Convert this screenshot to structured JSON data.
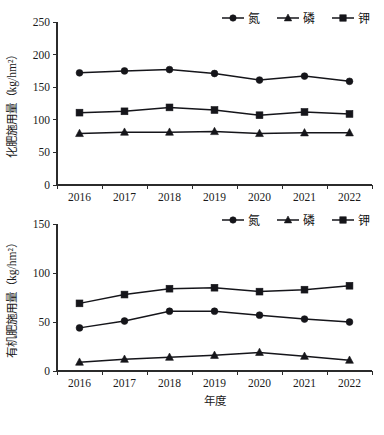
{
  "figure": {
    "panels": [
      {
        "id": "top",
        "legend": [
          {
            "label": "氮",
            "marker": "circle-marker"
          },
          {
            "label": "磷",
            "marker": "triangle-marker"
          },
          {
            "label": "钾",
            "marker": "square-marker"
          }
        ],
        "ylabel": "化肥施用量（kg/hm²）",
        "xlabel": "",
        "yticks": [
          "0",
          "50",
          "100",
          "150",
          "200",
          "250"
        ],
        "xticks": [
          "2016",
          "2017",
          "2018",
          "2019",
          "2020",
          "2021",
          "2022"
        ]
      },
      {
        "id": "bottom",
        "legend": [
          {
            "label": "氮",
            "marker": "circle-marker"
          },
          {
            "label": "磷",
            "marker": "triangle-marker"
          },
          {
            "label": "钾",
            "marker": "square-marker"
          }
        ],
        "ylabel": "有机肥施用量（kg/hm²）",
        "xlabel": "年度",
        "yticks": [
          "0",
          "50",
          "100",
          "150"
        ],
        "xticks": [
          "2016",
          "2017",
          "2018",
          "2019",
          "2020",
          "2021",
          "2022"
        ]
      }
    ]
  },
  "chart_data": [
    {
      "type": "line",
      "title": "",
      "xlabel": "",
      "ylabel": "化肥施用量（kg/hm²）",
      "categories": [
        "2016",
        "2017",
        "2018",
        "2019",
        "2020",
        "2021",
        "2022"
      ],
      "ylim": [
        0,
        250
      ],
      "yticks": [
        0,
        50,
        100,
        150,
        200,
        250
      ],
      "grid": false,
      "legend_position": "top-right",
      "series": [
        {
          "name": "氮",
          "marker": "circle",
          "values": [
            172,
            175,
            177,
            171,
            161,
            167,
            159
          ]
        },
        {
          "name": "磷",
          "marker": "triangle",
          "values": [
            79,
            81,
            81,
            82,
            79,
            80,
            80
          ]
        },
        {
          "name": "钾",
          "marker": "square",
          "values": [
            111,
            113,
            119,
            115,
            107,
            112,
            109
          ]
        }
      ]
    },
    {
      "type": "line",
      "title": "",
      "xlabel": "年度",
      "ylabel": "有机肥施用量（kg/hm²）",
      "categories": [
        "2016",
        "2017",
        "2018",
        "2019",
        "2020",
        "2021",
        "2022"
      ],
      "ylim": [
        0,
        150
      ],
      "yticks": [
        0,
        50,
        100,
        150
      ],
      "grid": false,
      "legend_position": "top-right",
      "series": [
        {
          "name": "氮",
          "marker": "circle",
          "values": [
            44,
            51,
            61,
            61,
            57,
            53,
            50
          ]
        },
        {
          "name": "磷",
          "marker": "triangle",
          "values": [
            9,
            12,
            14,
            16,
            19,
            15,
            11
          ]
        },
        {
          "name": "钾",
          "marker": "square",
          "values": [
            69,
            78,
            84,
            85,
            81,
            83,
            87
          ]
        }
      ]
    }
  ]
}
